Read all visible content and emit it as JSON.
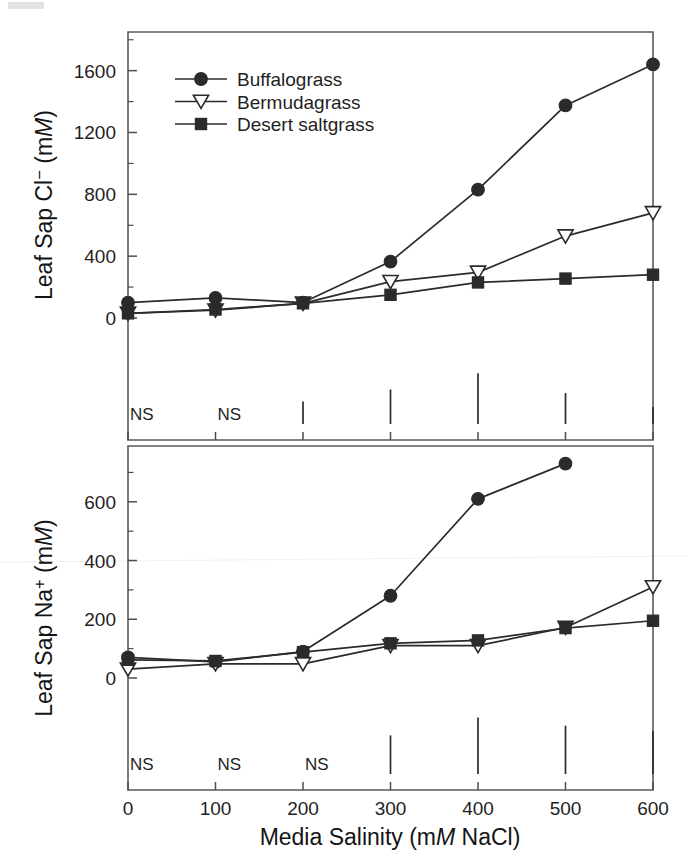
{
  "figure": {
    "background_color": "#ffffff",
    "ink_color": "#2b2b2b",
    "marker_open_fill": "#ffffff"
  },
  "xaxis": {
    "title_prefix": "Media Salinity (m",
    "title_italic": "M",
    "title_suffix": " NaCl)",
    "title_full": "Media Salinity (mM NaCl)",
    "ticks": [
      0,
      100,
      200,
      300,
      400,
      500,
      600
    ],
    "tick_labels": [
      "0",
      "100",
      "200",
      "300",
      "400",
      "500",
      "600"
    ],
    "range": [
      0,
      600
    ]
  },
  "panels": [
    {
      "id": "chloride",
      "ylabel_prefix": "Leaf Sap Cl",
      "ylabel_superscript": "−",
      "ylabel_mid": " (m",
      "ylabel_italic": "M",
      "ylabel_suffix": ")",
      "ylabel_full": "Leaf Sap Cl− (mM)",
      "ticks": [
        0,
        400,
        800,
        1200,
        1600
      ],
      "tick_labels": [
        "0",
        "400",
        "800",
        "1200",
        "1600"
      ],
      "minor_ticks": [
        200,
        600,
        1000,
        1400,
        1800
      ],
      "ylim": [
        0,
        1850
      ],
      "significance": [
        {
          "x": 0,
          "label": "NS",
          "lsd": null
        },
        {
          "x": 100,
          "label": "NS",
          "lsd": null
        },
        {
          "x": 200,
          "label": "",
          "lsd": 62
        },
        {
          "x": 300,
          "label": "",
          "lsd": 95
        },
        {
          "x": 400,
          "label": "",
          "lsd": 140
        },
        {
          "x": 500,
          "label": "",
          "lsd": 85
        },
        {
          "x": 600,
          "label": "",
          "lsd": 47
        }
      ]
    },
    {
      "id": "sodium",
      "ylabel_prefix": "Leaf Sap Na",
      "ylabel_superscript": "+",
      "ylabel_mid": " (m",
      "ylabel_italic": "M",
      "ylabel_suffix": ")",
      "ylabel_full": "Leaf Sap Na+ (mM)",
      "ticks": [
        0,
        200,
        400,
        600
      ],
      "tick_labels": [
        "0",
        "200",
        "400",
        "600"
      ],
      "minor_ticks": [
        100,
        300,
        500,
        700
      ],
      "ylim": [
        0,
        790
      ],
      "significance": [
        {
          "x": 0,
          "label": "NS",
          "lsd": null
        },
        {
          "x": 100,
          "label": "NS",
          "lsd": null
        },
        {
          "x": 200,
          "label": "NS",
          "lsd": null
        },
        {
          "x": 300,
          "label": "",
          "lsd": 56
        },
        {
          "x": 400,
          "label": "",
          "lsd": 82
        },
        {
          "x": 500,
          "label": "",
          "lsd": 70
        },
        {
          "x": 600,
          "label": "",
          "lsd": 62
        }
      ]
    }
  ],
  "legend": {
    "position": "top-left-inside-upper-panel",
    "entries": [
      {
        "label": "Buffalograss",
        "marker": "filled-circle"
      },
      {
        "label": "Bermudagrass",
        "marker": "open-down-triangle"
      },
      {
        "label": "Desert saltgrass",
        "marker": "filled-square"
      }
    ]
  },
  "chart_data": [
    {
      "type": "line",
      "panel": "top",
      "title": "",
      "xlabel": "Media Salinity (mM NaCl)",
      "ylabel": "Leaf Sap Cl− (mM)",
      "x": [
        0,
        100,
        200,
        300,
        400,
        500,
        600
      ],
      "xlim": [
        0,
        600
      ],
      "ylim": [
        0,
        1850
      ],
      "grid": false,
      "legend_position": "upper left",
      "series": [
        {
          "name": "Buffalograss",
          "marker": "filled-circle",
          "x": [
            0,
            100,
            200,
            300,
            400,
            500
          ],
          "values": [
            100,
            130,
            100,
            365,
            830,
            1375,
            1640
          ]
        },
        {
          "name": "Bermudagrass",
          "marker": "open-down-triangle",
          "x": [
            0,
            100,
            200,
            300,
            400,
            500,
            600
          ],
          "values": [
            30,
            50,
            95,
            235,
            295,
            530,
            680
          ]
        },
        {
          "name": "Desert saltgrass",
          "marker": "filled-square",
          "x": [
            0,
            100,
            200,
            300,
            400,
            500,
            600
          ],
          "values": [
            30,
            55,
            95,
            150,
            230,
            255,
            280
          ]
        }
      ]
    },
    {
      "type": "line",
      "panel": "bottom",
      "title": "",
      "xlabel": "Media Salinity (mM NaCl)",
      "ylabel": "Leaf Sap Na+ (mM)",
      "x": [
        0,
        100,
        200,
        300,
        400,
        500,
        600
      ],
      "xlim": [
        0,
        600
      ],
      "ylim": [
        0,
        790
      ],
      "grid": false,
      "legend_position": "none",
      "series": [
        {
          "name": "Buffalograss",
          "marker": "filled-circle",
          "x": [
            0,
            100,
            200,
            300,
            400,
            500
          ],
          "values": [
            70,
            55,
            90,
            280,
            610,
            730
          ]
        },
        {
          "name": "Bermudagrass",
          "marker": "open-down-triangle",
          "x": [
            0,
            100,
            200,
            300,
            400,
            500,
            600
          ],
          "values": [
            30,
            48,
            48,
            110,
            110,
            172,
            310
          ]
        },
        {
          "name": "Desert saltgrass",
          "marker": "filled-square",
          "x": [
            0,
            100,
            200,
            300,
            400,
            500,
            600
          ],
          "values": [
            62,
            58,
            88,
            118,
            128,
            170,
            195
          ]
        }
      ]
    }
  ]
}
